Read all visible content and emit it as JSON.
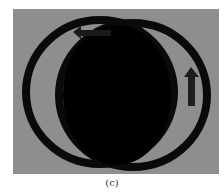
{
  "figure": {
    "caption": "(c)",
    "panel_background": "#8e8e8e",
    "ring_color": "#0a0a0a",
    "disk_color": "#000000",
    "arrow_color": "#1e1e1e",
    "elements": [
      {
        "type": "ring",
        "position": "left"
      },
      {
        "type": "ring",
        "position": "right"
      },
      {
        "type": "solid-disk",
        "position": "center"
      },
      {
        "type": "arrow",
        "direction": "left",
        "position": "top-left"
      },
      {
        "type": "arrow",
        "direction": "up",
        "position": "right"
      }
    ]
  }
}
